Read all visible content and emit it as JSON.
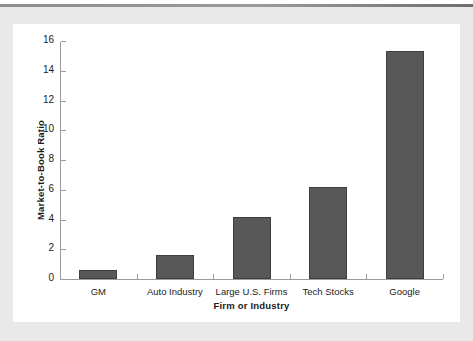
{
  "figure": {
    "panel_background": "#ffffff",
    "page_background": "#e9e9e9",
    "rule_color": "#8d8d8d"
  },
  "chart_data": {
    "type": "bar",
    "title": "",
    "subtitle": "",
    "xlabel": "Firm or Industry",
    "ylabel": "Market-to-Book Ratio",
    "categories": [
      "GM",
      "Auto Industry",
      "Large U.S. Firms",
      "Tech Stocks",
      "Google"
    ],
    "values": [
      0.6,
      1.6,
      4.2,
      6.2,
      15.3
    ],
    "ylim": [
      0,
      16
    ],
    "ytick_labels": [
      "0",
      "2",
      "4",
      "6",
      "8",
      "10",
      "12",
      "14",
      "16"
    ],
    "ytick_values": [
      0,
      2,
      4,
      6,
      8,
      10,
      12,
      14,
      16
    ],
    "grid": false,
    "legend": false,
    "legend_position": "none",
    "bar_color": "#585858",
    "bar_edge_color": "#3f3f3f",
    "axis_color": "#9b9b9b",
    "tick_direction": "in"
  }
}
